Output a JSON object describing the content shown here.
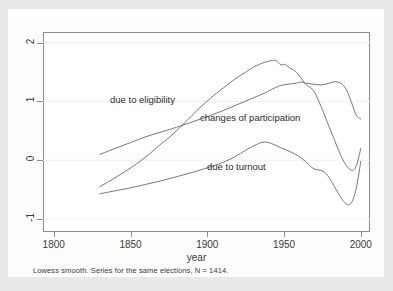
{
  "figure": {
    "background_color": "#e9e9e9",
    "panel_color": "#fdfdfd",
    "plot_background": "#ffffff",
    "frame_color": "#8d8d8d",
    "curve_color": "#5f5f5f"
  },
  "caption": "Lowess smooth. Series for the same elections, N = 1414.",
  "chart_data": {
    "type": "line",
    "title": "",
    "subtitle": "",
    "xlabel": "year",
    "ylabel": "",
    "xlim": [
      1793,
      2006
    ],
    "ylim": [
      -1.22,
      2.18
    ],
    "xticks": [
      1800,
      1850,
      1900,
      1950,
      2000
    ],
    "xticklabels": [
      "1800",
      "1850",
      "1900",
      "1950",
      "2000"
    ],
    "yticks": [
      -1,
      0,
      1,
      2
    ],
    "yticklabels": [
      "-1",
      "0",
      "1",
      "2"
    ],
    "grid": "horizontal-faint",
    "legend": "inline-annotations",
    "annotations": [
      {
        "text": "due to eligibility",
        "x": 1855,
        "y": 1.02
      },
      {
        "text": "changes of participation",
        "x": 1913,
        "y": 0.8
      },
      {
        "text": "due to turnout",
        "x": 1917,
        "y": 0.06
      }
    ],
    "series": [
      {
        "name": "due to eligibility",
        "label": "due to eligibility",
        "x": [
          1830,
          1838,
          1846,
          1854,
          1862,
          1870,
          1874,
          1882,
          1890,
          1898,
          1906,
          1912,
          1918,
          1924,
          1930,
          1934,
          1938,
          1941,
          1944,
          1946,
          1948,
          1951,
          1953,
          1955,
          1957,
          1959,
          1961,
          1963,
          1965,
          1967,
          1970,
          1974,
          1978,
          1982,
          1986,
          1990,
          1994,
          1997,
          2000
        ],
        "y": [
          -0.45,
          -0.33,
          -0.2,
          -0.06,
          0.1,
          0.28,
          0.36,
          0.55,
          0.76,
          0.96,
          1.14,
          1.26,
          1.38,
          1.48,
          1.58,
          1.63,
          1.67,
          1.69,
          1.7,
          1.67,
          1.62,
          1.63,
          1.58,
          1.55,
          1.52,
          1.47,
          1.4,
          1.33,
          1.27,
          1.24,
          1.15,
          0.92,
          0.66,
          0.4,
          0.14,
          -0.07,
          -0.17,
          -0.1,
          0.2
        ]
      },
      {
        "name": "changes of participation",
        "label": "changes of participation",
        "x": [
          1830,
          1840,
          1850,
          1860,
          1870,
          1880,
          1890,
          1900,
          1910,
          1920,
          1930,
          1938,
          1944,
          1948,
          1952,
          1955,
          1958,
          1961,
          1964,
          1967,
          1970,
          1974,
          1978,
          1982,
          1985,
          1988,
          1991,
          1994,
          1997,
          2000
        ],
        "y": [
          0.1,
          0.2,
          0.3,
          0.4,
          0.48,
          0.56,
          0.65,
          0.74,
          0.84,
          0.95,
          1.06,
          1.15,
          1.23,
          1.27,
          1.29,
          1.3,
          1.31,
          1.33,
          1.31,
          1.3,
          1.29,
          1.28,
          1.3,
          1.33,
          1.33,
          1.29,
          1.18,
          0.98,
          0.77,
          0.7
        ]
      },
      {
        "name": "due to turnout",
        "label": "due to turnout",
        "x": [
          1830,
          1840,
          1850,
          1860,
          1870,
          1880,
          1890,
          1900,
          1910,
          1918,
          1925,
          1930,
          1934,
          1937,
          1940,
          1944,
          1948,
          1952,
          1956,
          1960,
          1964,
          1968,
          1971,
          1974,
          1977,
          1980,
          1984,
          1988,
          1991,
          1994,
          1997,
          2000
        ],
        "y": [
          -0.57,
          -0.52,
          -0.47,
          -0.41,
          -0.35,
          -0.28,
          -0.21,
          -0.13,
          -0.04,
          0.06,
          0.17,
          0.24,
          0.29,
          0.31,
          0.3,
          0.26,
          0.21,
          0.17,
          0.12,
          0.06,
          -0.02,
          -0.12,
          -0.16,
          -0.17,
          -0.22,
          -0.32,
          -0.5,
          -0.67,
          -0.75,
          -0.72,
          -0.48,
          -0.02
        ]
      }
    ]
  }
}
